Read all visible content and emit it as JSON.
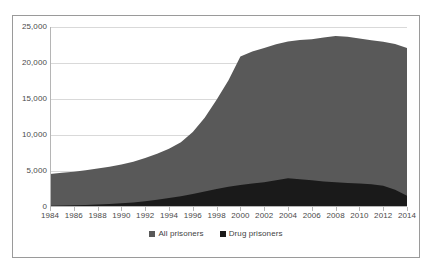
{
  "chart_data": {
    "type": "area",
    "title": "",
    "subtitle": "",
    "xlabel": "",
    "ylabel": "",
    "stacked": false,
    "grid": true,
    "legend_position": "bottom",
    "xlim": [
      1984,
      2014
    ],
    "ylim": [
      0,
      25000
    ],
    "x_tick_labels": [
      "1984",
      "1986",
      "1988",
      "1990",
      "1992",
      "1994",
      "1996",
      "1998",
      "2000",
      "2002",
      "2004",
      "2006",
      "2008",
      "2010",
      "2012",
      "2014"
    ],
    "y_tick_labels": [
      "0",
      "5,000",
      "10,000",
      "15,000",
      "20,000",
      "25,000"
    ],
    "y_ticks": [
      0,
      5000,
      10000,
      15000,
      20000,
      25000
    ],
    "x": [
      1984,
      1985,
      1986,
      1987,
      1988,
      1989,
      1990,
      1991,
      1992,
      1993,
      1994,
      1995,
      1996,
      1997,
      1998,
      1999,
      2000,
      2001,
      2002,
      2003,
      2004,
      2005,
      2006,
      2007,
      2008,
      2009,
      2010,
      2011,
      2012,
      2013,
      2014
    ],
    "series": [
      {
        "name": "All prisoners",
        "color": "#595959",
        "values": [
          4600,
          4750,
          4900,
          5100,
          5350,
          5600,
          5900,
          6300,
          6800,
          7400,
          8100,
          9000,
          10400,
          12400,
          14900,
          17600,
          20900,
          21600,
          22100,
          22600,
          23000,
          23200,
          23300,
          23550,
          23750,
          23650,
          23400,
          23150,
          22950,
          22650,
          22100
        ]
      },
      {
        "name": "Drug prisoners",
        "color": "#1a1a1a",
        "values": [
          180,
          200,
          230,
          280,
          340,
          420,
          520,
          640,
          800,
          1000,
          1250,
          1500,
          1800,
          2150,
          2500,
          2800,
          3050,
          3250,
          3450,
          3700,
          4000,
          3850,
          3700,
          3550,
          3450,
          3350,
          3250,
          3150,
          2950,
          2400,
          1550
        ]
      }
    ]
  },
  "legend": {
    "items": [
      {
        "label": "All prisoners",
        "color": "#595959"
      },
      {
        "label": "Drug prisoners",
        "color": "#1a1a1a"
      }
    ]
  }
}
